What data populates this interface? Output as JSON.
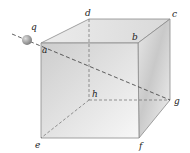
{
  "figure": {
    "type": "cube-with-charge",
    "charge_label": "q",
    "vertex_labels": {
      "a": "a",
      "b": "b",
      "c": "c",
      "d": "d",
      "e": "e",
      "f": "f",
      "g": "g",
      "h": "h"
    },
    "colors": {
      "edge": "#8a8a8a",
      "dashed": "#3a3a3a",
      "front_face_light": "#f4f4f4",
      "front_face_dark": "#cfcfcf",
      "sphere": "#9a9a9a"
    }
  }
}
